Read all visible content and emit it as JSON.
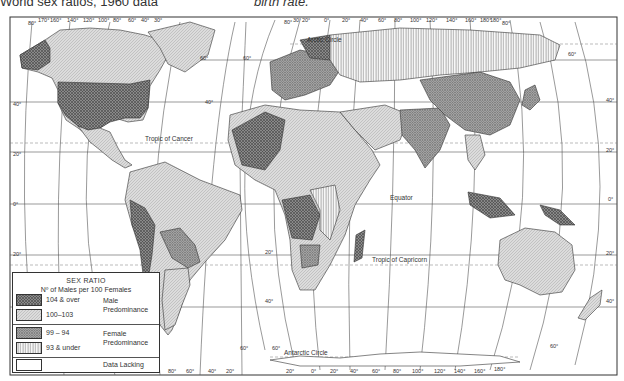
{
  "captions": {
    "left": "World sex ratios, 1960 data",
    "right": "birth rate."
  },
  "map": {
    "title": "World Sex Ratio Map",
    "labels": {
      "arctic_circle": "Arctic Circle",
      "tropic_of_cancer": "Tropic of Cancer",
      "equator": "Equator",
      "tropic_of_capricorn": "Tropic of Capricorn",
      "antarctic_circle": "Antarctic Circle"
    },
    "top_longitudes_left": [
      "80°",
      "170°",
      "160°",
      "140°",
      "120°",
      "100°",
      "80°",
      "60°",
      "40°",
      "30°"
    ],
    "top_longitudes_right": [
      "80°",
      "30°",
      "20°",
      "0°",
      "20°",
      "40°",
      "60°",
      "80°",
      "100°",
      "120°",
      "140°",
      "160°",
      "180°",
      "180°",
      "80°"
    ],
    "bottom_longitudes_left": [
      "100°",
      "80°",
      "60°",
      "40°",
      "20°"
    ],
    "bottom_longitudes_right": [
      "20°",
      "0°",
      "20°",
      "40°",
      "60°",
      "80°",
      "100°",
      "120°",
      "140°",
      "160°",
      "180°"
    ],
    "latitudes_left": [
      "40°",
      "20°",
      "0°",
      "20°"
    ],
    "latitudes_mid": [
      "60°",
      "60°",
      "40°",
      "20°",
      "40°",
      "60°",
      "60°"
    ],
    "latitudes_right": [
      "60°",
      "40°",
      "20°",
      "0°",
      "20°",
      "40°",
      "60°"
    ]
  },
  "legend": {
    "title": "SEX RATIO",
    "subtitle": "Nº of Males per 100 Females",
    "groups": {
      "male": [
        "Male",
        "Predominance"
      ],
      "female": [
        "Female",
        "Predominance"
      ]
    },
    "items": [
      {
        "label": "104 & over",
        "pattern": "dark-crosshatch"
      },
      {
        "label": "100–103",
        "pattern": "light-crosshatch"
      },
      {
        "label": "99 – 94",
        "pattern": "dense-diagonal"
      },
      {
        "label": "93 & under",
        "pattern": "vertical-lines"
      },
      {
        "label": "Data Lacking",
        "pattern": "blank"
      }
    ]
  },
  "colors": {
    "ink": "#333333",
    "dark_fill": "#8a8a8a",
    "light_fill": "#d8d8d8",
    "grid": "#555555"
  }
}
